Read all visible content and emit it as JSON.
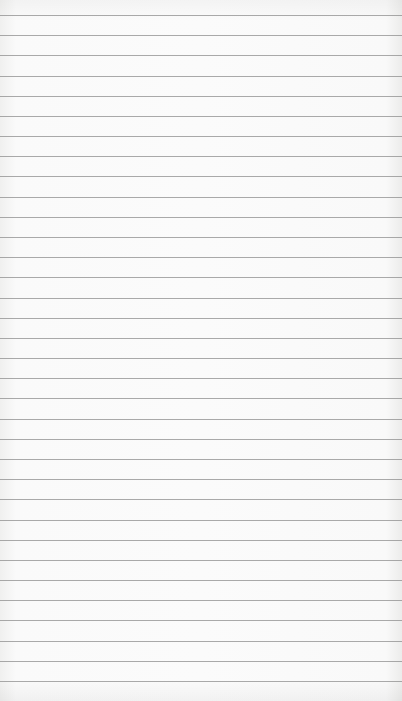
{
  "page": {
    "type": "lined-paper",
    "background_color": "#fbfbfb",
    "rule_color": "#8e8e8e",
    "rule_count": 34,
    "first_rule_y": 15,
    "rule_spacing": 20.18
  }
}
